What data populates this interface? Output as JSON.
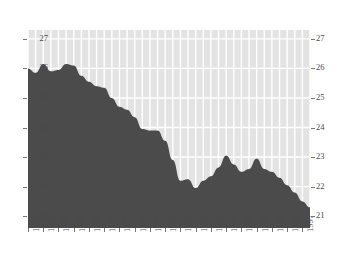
{
  "chart_data": {
    "type": "area",
    "title": "",
    "subtitle": "",
    "xlabel": "",
    "ylabel": "",
    "xlim": [
      1961,
      1998
    ],
    "ylim": [
      20.6,
      27.3
    ],
    "yticks": [
      21,
      22,
      23,
      24,
      25,
      26,
      27
    ],
    "ytick_labels": [
      "21",
      "22",
      "23",
      "24",
      "25",
      "26",
      "27"
    ],
    "y_axis_left_labels": [
      "27",
      "26",
      "25",
      "24",
      "23",
      "22",
      "21"
    ],
    "y_axis_right_labels": [
      "27",
      "26",
      "25",
      "24",
      "23",
      "22",
      "21"
    ],
    "xticks": [
      1961,
      1963,
      1965,
      1967,
      1969,
      1971,
      1973,
      1975,
      1977,
      1979,
      1981,
      1983,
      1985,
      1987,
      1989,
      1991,
      1993,
      1995,
      1997
    ],
    "xtick_labels": [
      "1961",
      "1963",
      "1965",
      "1967",
      "1969",
      "1971",
      "1973",
      "1975",
      "1977",
      "1979",
      "1981",
      "1983",
      "1985",
      "1987",
      "1989",
      "1991",
      "1993",
      "1995",
      "1997"
    ],
    "grid": true,
    "grid_color": "#ffffff",
    "plot_background": "#e3e3e3",
    "fill_color": "#4b4b4b",
    "legend": null,
    "legend_position": "none",
    "x": [
      1961,
      1962,
      1963,
      1964,
      1965,
      1966,
      1967,
      1968,
      1969,
      1970,
      1971,
      1972,
      1973,
      1974,
      1975,
      1976,
      1977,
      1978,
      1979,
      1980,
      1981,
      1982,
      1983,
      1984,
      1985,
      1986,
      1987,
      1988,
      1989,
      1990,
      1991,
      1992,
      1993,
      1994,
      1995,
      1996,
      1997,
      1998
    ],
    "values": [
      26.0,
      25.85,
      26.15,
      25.9,
      25.95,
      26.15,
      26.1,
      25.75,
      25.55,
      25.4,
      25.35,
      25.0,
      24.7,
      24.6,
      24.35,
      23.95,
      23.9,
      23.9,
      23.55,
      22.9,
      22.2,
      22.25,
      21.95,
      22.2,
      22.35,
      22.65,
      23.05,
      22.75,
      22.5,
      22.6,
      22.95,
      22.6,
      22.5,
      22.3,
      22.05,
      21.8,
      21.5,
      21.3
    ],
    "series": [
      {
        "name": "series-1",
        "values": [
          26.0,
          25.85,
          26.15,
          25.9,
          25.95,
          26.15,
          26.1,
          25.75,
          25.55,
          25.4,
          25.35,
          25.0,
          24.7,
          24.6,
          24.35,
          23.95,
          23.9,
          23.9,
          23.55,
          22.9,
          22.2,
          22.25,
          21.95,
          22.2,
          22.35,
          22.65,
          23.05,
          22.75,
          22.5,
          22.6,
          22.95,
          22.6,
          22.5,
          22.3,
          22.05,
          21.8,
          21.5,
          21.3
        ]
      }
    ]
  }
}
